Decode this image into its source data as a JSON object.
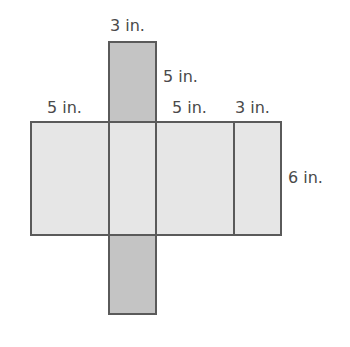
{
  "diagram": {
    "type": "net of rectangular prism",
    "labels": {
      "top_strip_width": "3 in.",
      "top_strip_height": "5 in.",
      "left_face_width": "5 in.",
      "right_mid_face_width": "5 in.",
      "right_face_width": "3 in.",
      "face_height": "6 in."
    },
    "colors": {
      "light_face": "#e6e6e6",
      "dark_face": "#c4c4c4",
      "border": "#5a5a5a",
      "text": "#4a4a4a"
    }
  }
}
